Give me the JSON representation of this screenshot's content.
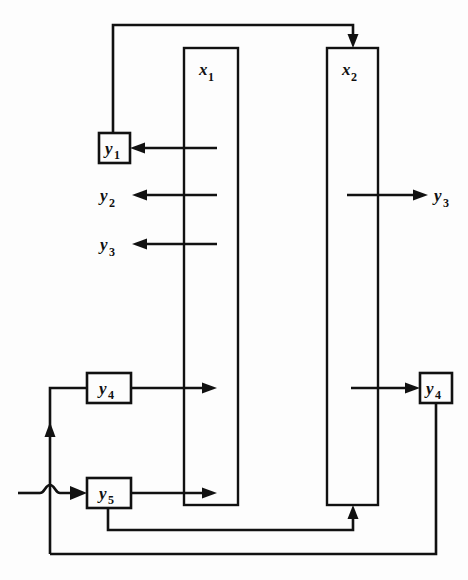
{
  "diagram": {
    "background_color": "#fdfdfd",
    "line_color": "#111111",
    "columns": [
      {
        "id": "x1",
        "base": "x",
        "sub": "1",
        "label": "x1"
      },
      {
        "id": "x2",
        "base": "x",
        "sub": "2",
        "label": "x2"
      }
    ],
    "boxes": [
      {
        "id": "y1-box",
        "base": "y",
        "sub": "1",
        "label": "y1"
      },
      {
        "id": "y4-left-box",
        "base": "y",
        "sub": "4",
        "label": "y4"
      },
      {
        "id": "y5-box",
        "base": "y",
        "sub": "5",
        "label": "y5"
      },
      {
        "id": "y4-right-box",
        "base": "y",
        "sub": "4",
        "label": "y4"
      }
    ],
    "free_labels": [
      {
        "id": "y2-label",
        "base": "y",
        "sub": "2",
        "label": "y2"
      },
      {
        "id": "y3-label-left",
        "base": "y",
        "sub": "3",
        "label": "y3"
      },
      {
        "id": "y3-label-right",
        "base": "y",
        "sub": "3",
        "label": "y3"
      }
    ]
  }
}
